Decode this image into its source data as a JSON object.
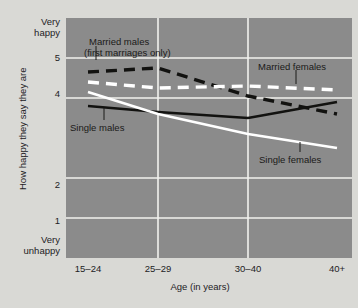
{
  "figure": {
    "background_color": "#d9d9d5",
    "plot_background_color": "#8b8b8b",
    "grid_color": "#f2f2ee"
  },
  "axis": {
    "y_title": "How happy they say they are",
    "x_title": "Age (in years)",
    "y_top_label_line1": "Very",
    "y_top_label_line2": "happy",
    "y_bottom_label_line1": "Very",
    "y_bottom_label_line2": "unhappy",
    "y_tick_5": "5",
    "y_tick_4": "4",
    "y_tick_2": "2",
    "y_tick_1": "1",
    "x_tick_0": "15–24",
    "x_tick_1": "25–29",
    "x_tick_2": "30–40",
    "x_tick_3": "40+"
  },
  "annotations": {
    "married_males_line1": "Married males",
    "married_males_line2": "(first  marriages only)",
    "married_females": "Married females",
    "single_males": "Single males",
    "single_females": "Single females"
  },
  "chart_data": {
    "type": "line",
    "title": "",
    "xlabel": "Age (in years)",
    "ylabel": "How happy they say they are",
    "categories": [
      "15–24",
      "25–29",
      "30–40",
      "40+"
    ],
    "ylim": [
      0,
      6
    ],
    "ytick_values": [
      5,
      4,
      2,
      1
    ],
    "ytick_labels": [
      "5",
      "4",
      "2",
      "1"
    ],
    "y_axis_endpoint_labels": {
      "top": "Very happy",
      "bottom": "Very unhappy"
    },
    "grid": true,
    "legend_position": "inline-annotations",
    "series": [
      {
        "name": "Married males (first marriages only)",
        "values": [
          4.65,
          4.75,
          4.05,
          3.6
        ],
        "color": "#121210",
        "style": "dashed"
      },
      {
        "name": "Married females",
        "values": [
          4.4,
          4.25,
          4.3,
          4.2
        ],
        "color": "#ffffff",
        "style": "dashed"
      },
      {
        "name": "Single males",
        "values": [
          3.8,
          3.65,
          3.5,
          3.9
        ],
        "color": "#121210",
        "style": "solid"
      },
      {
        "name": "Single females",
        "values": [
          4.15,
          3.6,
          3.1,
          2.75
        ],
        "color": "#ffffff",
        "style": "solid"
      }
    ]
  }
}
